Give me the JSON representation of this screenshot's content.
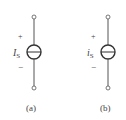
{
  "figures": [
    {
      "id": "a",
      "caption": "(a)",
      "source_label": {
        "main": "I",
        "sub": "S"
      },
      "polarity": {
        "top": "+",
        "bottom": "−"
      },
      "symbol": "current-source-horizontal-bar"
    },
    {
      "id": "b",
      "caption": "(b)",
      "source_label": {
        "main": "i",
        "sub": "S"
      },
      "polarity": {
        "top": "+",
        "bottom": "−"
      },
      "symbol": "current-source-horizontal-bar"
    }
  ],
  "colors": {
    "stroke": "#444444",
    "background": "#ffffff"
  }
}
